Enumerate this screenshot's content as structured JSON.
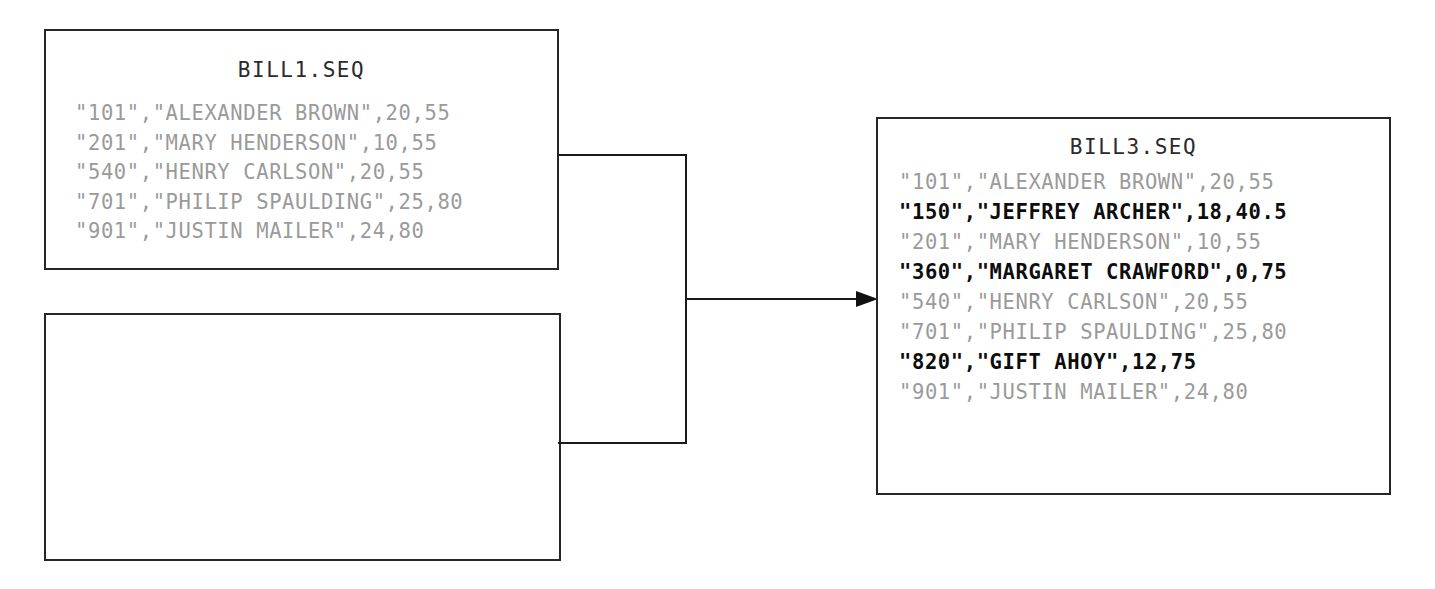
{
  "diagram": {
    "type": "sequential-file-merge",
    "line_color": "#1a1a1a",
    "existing_record_color": "#9a9a9a",
    "new_record_color": "#0d0d0d"
  },
  "source_file": {
    "name": "BILL1.SEQ",
    "records": [
      {
        "text": "\"101\",\"ALEXANDER BROWN\",20,55",
        "is_new": false
      },
      {
        "text": "\"201\",\"MARY HENDERSON\",10,55",
        "is_new": false
      },
      {
        "text": "\"540\",\"HENRY CARLSON\",20,55",
        "is_new": false
      },
      {
        "text": "\"701\",\"PHILIP SPAULDING\",25,80",
        "is_new": false
      },
      {
        "text": "\"901\",\"JUSTIN MAILER\",24,80",
        "is_new": false
      }
    ]
  },
  "secondary_file": {
    "name": "",
    "records": []
  },
  "result_file": {
    "name": "BILL3.SEQ",
    "records": [
      {
        "text": "\"101\",\"ALEXANDER BROWN\",20,55",
        "is_new": false
      },
      {
        "text": "\"150\",\"JEFFREY ARCHER\",18,40.5",
        "is_new": true
      },
      {
        "text": "\"201\",\"MARY HENDERSON\",10,55",
        "is_new": false
      },
      {
        "text": "\"360\",\"MARGARET CRAWFORD\",0,75",
        "is_new": true
      },
      {
        "text": "\"540\",\"HENRY CARLSON\",20,55",
        "is_new": false
      },
      {
        "text": "\"701\",\"PHILIP SPAULDING\",25,80",
        "is_new": false
      },
      {
        "text": "\"820\",\"GIFT AHOY\",12,75",
        "is_new": true
      },
      {
        "text": "\"901\",\"JUSTIN MAILER\",24,80",
        "is_new": false
      }
    ]
  },
  "connector": {
    "name": "merge-arrow",
    "direction": "right"
  }
}
